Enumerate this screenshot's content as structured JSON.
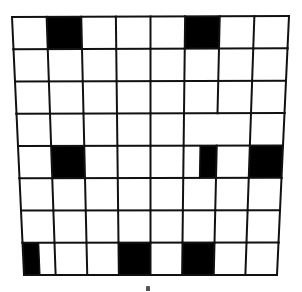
{
  "figure": {
    "type": "grid-puzzle",
    "rows": 8,
    "cols": 8,
    "colors": {
      "background": "#ffffff",
      "line": "#111111",
      "filled": "#000000",
      "mark": "#555555"
    },
    "corners": {
      "top_left": [
        12,
        17
      ],
      "top_right": [
        289,
        16
      ],
      "bottom_left": [
        24,
        275
      ],
      "bottom_right": [
        277,
        275
      ]
    },
    "filled_cells": [
      {
        "row": 0,
        "col": 1,
        "part": "full"
      },
      {
        "row": 0,
        "col": 5,
        "part": "full"
      },
      {
        "row": 4,
        "col": 1,
        "part": "full"
      },
      {
        "row": 4,
        "col": 5,
        "part": "right-half"
      },
      {
        "row": 4,
        "col": 7,
        "part": "full"
      },
      {
        "row": 7,
        "col": 0,
        "part": "left-half"
      },
      {
        "row": 7,
        "col": 3,
        "part": "full"
      },
      {
        "row": 7,
        "col": 5,
        "part": "full"
      }
    ],
    "split_cells": [
      {
        "row": 4,
        "col": 5,
        "split_at": 0.5
      },
      {
        "row": 7,
        "col": 0,
        "split_at": 0.5
      }
    ],
    "merged_cells": [
      {
        "row": 3,
        "cols": [
          5,
          6
        ]
      }
    ],
    "caption_mark": "▴"
  }
}
